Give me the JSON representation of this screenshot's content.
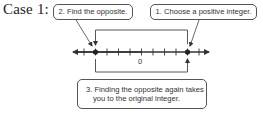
{
  "case_label": "Case 1:",
  "callouts": {
    "step1": "1. Choose a positive integer.",
    "step2": "2. Find the opposite.",
    "step3_line1": "3. Finding the opposite again takes",
    "step3_line2": "you to the original integer."
  },
  "number_line": {
    "zero_label": "0",
    "tick_min": -6,
    "tick_max": 6,
    "points": [
      {
        "name": "opposite",
        "value": -4
      },
      {
        "name": "positive-integer",
        "value": 4
      }
    ]
  },
  "colors": {
    "line": "#333333",
    "box_border": "#555555",
    "text": "#333333"
  }
}
